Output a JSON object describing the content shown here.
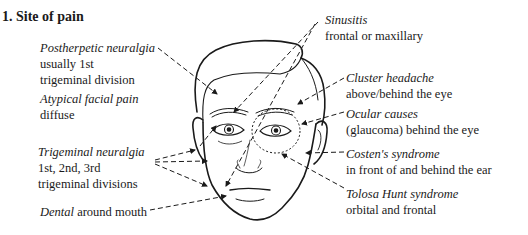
{
  "section": {
    "number": "1.",
    "title": "1. Site of pain"
  },
  "labels": {
    "postherpetic": {
      "name": "Postherpetic neuralgia",
      "desc1": "usually 1st",
      "desc2": "trigeminal division"
    },
    "atypical": {
      "name": "Atypical facial pain",
      "desc1": "diffuse"
    },
    "trigeminal": {
      "name": "Trigeminal neuralgia",
      "desc1": "1st, 2nd, 3rd",
      "desc2": "trigeminal divisions"
    },
    "dental": {
      "name": "Dental",
      "desc1": "around mouth"
    },
    "sinusitis": {
      "name": "Sinusitis",
      "desc1": "frontal or maxillary"
    },
    "cluster": {
      "name": "Cluster headache",
      "desc1": "above/behind the eye"
    },
    "ocular": {
      "name": "Ocular causes",
      "desc1": "(glaucoma) behind the eye"
    },
    "costen": {
      "name": "Costen's syndrome",
      "desc1": "in front of and behind the ear"
    },
    "tolosa": {
      "name": "Tolosa Hunt syndrome",
      "desc1": "orbital and frontal"
    }
  },
  "figure": {
    "line_color": "#1a1a1a",
    "background": "#ffffff"
  }
}
